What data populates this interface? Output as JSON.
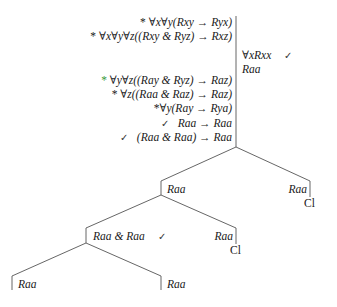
{
  "trunk": {
    "left_column": [
      {
        "marker": "*",
        "marker_color": "#1a1a1a",
        "formula": "∀x∀y(Rxy → Ryx)",
        "check": false
      },
      {
        "marker": "*",
        "marker_color": "#1a1a1a",
        "formula": "∀x∀y∀z((Rxy & Ryz) → Rxz)",
        "check": false
      },
      {
        "marker": "*",
        "marker_color": "#3a9a3a",
        "formula": "∀y∀z((Ray & Ryz) → Raz)",
        "check": false
      },
      {
        "marker": "*",
        "marker_color": "#1a1a1a",
        "formula": "∀z((Raa & Raz) → Raz)",
        "check": false
      },
      {
        "marker": "*",
        "marker_color": "#1a1a1a",
        "formula": "∀y(Ray → Rya)",
        "check": false
      },
      {
        "marker": "✓",
        "marker_color": "#333333",
        "formula": "Raa → Raa",
        "check": true
      },
      {
        "marker": "✓",
        "marker_color": "#333333",
        "formula": "(Raa & Raa) → Raa",
        "check": true
      }
    ],
    "right_column": [
      {
        "formula": "∀xRxx",
        "check": "✓"
      },
      {
        "formula": "Raa",
        "check": ""
      }
    ]
  },
  "branches": {
    "level1": {
      "left": {
        "formula": "Raa"
      },
      "right": {
        "formula": "Raa",
        "closed": "Cl"
      }
    },
    "level2": {
      "left": {
        "formula": "Raa & Raa",
        "check": "✓"
      },
      "right": {
        "formula": "Raa",
        "closed": "Cl"
      }
    },
    "level3": {
      "left": {
        "formula": "Raa"
      },
      "right": {
        "formula": "Raa"
      }
    }
  }
}
